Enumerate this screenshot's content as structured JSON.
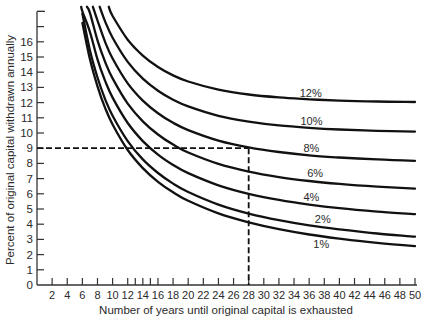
{
  "chart_data": {
    "type": "line",
    "title": "",
    "xlabel": "Number of years until original capital is exhausted",
    "ylabel": "Percent of original capital withdrawn annually",
    "xlim": [
      0,
      50
    ],
    "ylim": [
      0,
      18
    ],
    "grid": false,
    "legend": "inline labels on curves",
    "x_ticks": [
      2,
      4,
      6,
      8,
      10,
      12,
      13,
      14,
      15,
      16,
      18,
      20,
      22,
      24,
      26,
      28,
      30,
      32,
      34,
      36,
      38,
      40,
      42,
      44,
      46,
      48,
      50
    ],
    "x_tick_labels": [
      "2",
      "4",
      "6",
      "8",
      "10",
      "12",
      "14",
      "16",
      "18",
      "20",
      "22",
      "24",
      "26",
      "28",
      "30",
      "32",
      "34",
      "36",
      "38",
      "40",
      "42",
      "44",
      "46",
      "48",
      "50"
    ],
    "x_tick_label_values": [
      2,
      4,
      6,
      8,
      10,
      12,
      14,
      16,
      18,
      20,
      22,
      24,
      26,
      28,
      30,
      32,
      34,
      36,
      38,
      40,
      42,
      44,
      46,
      48,
      50
    ],
    "y_ticks": [
      1,
      2,
      3,
      4,
      5,
      6,
      7,
      8,
      9,
      10,
      11,
      12,
      13,
      14,
      15,
      16,
      17,
      18
    ],
    "y_tick_labels": [
      "0",
      "1",
      "2",
      "3",
      "4",
      "5",
      "6",
      "7",
      "8",
      "9",
      "10",
      "11",
      "12",
      "13",
      "14",
      "15",
      "16"
    ],
    "series": [
      {
        "name": "1%",
        "label": "1%",
        "label_pos": [
          37.6,
          2.7
        ],
        "x": [
          6,
          7,
          8,
          9,
          10,
          12,
          14,
          16,
          18,
          20,
          24,
          28,
          32,
          36,
          40,
          45,
          50
        ],
        "values": [
          17.25,
          14.86,
          13.07,
          11.67,
          10.56,
          8.88,
          7.69,
          6.79,
          6.1,
          5.54,
          4.71,
          4.12,
          3.67,
          3.32,
          3.05,
          2.77,
          2.56
        ]
      },
      {
        "name": "2%",
        "label": "2%",
        "label_pos": [
          37.8,
          4.35
        ],
        "x": [
          6,
          7,
          8,
          9,
          10,
          12,
          14,
          16,
          18,
          20,
          24,
          28,
          32,
          36,
          40,
          45,
          50
        ],
        "values": [
          17.85,
          15.45,
          13.65,
          12.25,
          11.13,
          9.46,
          8.26,
          7.37,
          6.67,
          6.12,
          5.29,
          4.7,
          4.26,
          3.92,
          3.66,
          3.39,
          3.18
        ]
      },
      {
        "name": "4%",
        "label": "4%",
        "label_pos": [
          36.3,
          5.8
        ],
        "x": [
          5.85,
          6,
          7,
          8,
          9,
          10,
          12,
          14,
          16,
          18,
          20,
          24,
          28,
          32,
          36,
          40,
          45,
          50
        ],
        "values": [
          18.3,
          18.0,
          16.66,
          14.85,
          13.45,
          12.33,
          10.66,
          9.47,
          8.58,
          7.9,
          7.36,
          6.56,
          6.0,
          5.6,
          5.29,
          5.05,
          4.83,
          4.66
        ]
      },
      {
        "name": "6%",
        "label": "6%",
        "label_pos": [
          36.8,
          7.4
        ],
        "x": [
          6.6,
          7,
          8,
          9,
          10,
          12,
          14,
          16,
          18,
          20,
          24,
          28,
          32,
          36,
          40,
          45,
          50
        ],
        "values": [
          18.3,
          17.91,
          16.1,
          14.7,
          13.59,
          11.93,
          10.76,
          9.9,
          9.24,
          8.72,
          7.97,
          7.46,
          7.1,
          6.84,
          6.65,
          6.47,
          6.34
        ]
      },
      {
        "name": "8%",
        "label": "8%",
        "label_pos": [
          36.3,
          9.0
        ],
        "x": [
          7.4,
          8,
          9,
          10,
          12,
          14,
          16,
          18,
          20,
          24,
          28,
          32,
          36,
          40,
          45,
          50
        ],
        "values": [
          18.3,
          17.4,
          16.01,
          14.9,
          13.27,
          12.13,
          11.3,
          10.67,
          10.19,
          9.5,
          9.05,
          8.75,
          8.53,
          8.39,
          8.26,
          8.17
        ]
      },
      {
        "name": "10%",
        "label": "10%",
        "label_pos": [
          36.3,
          10.8
        ],
        "x": [
          8.3,
          9,
          10,
          12,
          14,
          16,
          18,
          20,
          24,
          28,
          32,
          36,
          40,
          45,
          50
        ],
        "values": [
          18.3,
          17.36,
          16.27,
          14.68,
          13.57,
          12.78,
          12.19,
          11.75,
          11.13,
          10.75,
          10.5,
          10.34,
          10.23,
          10.14,
          10.09
        ]
      },
      {
        "name": "12%",
        "label": "12%",
        "label_pos": [
          36.2,
          12.65
        ],
        "x": [
          9.5,
          10,
          12,
          14,
          16,
          18,
          20,
          24,
          28,
          32,
          36,
          40,
          45,
          50
        ],
        "values": [
          18.3,
          17.7,
          16.14,
          15.09,
          14.34,
          13.79,
          13.39,
          12.85,
          12.53,
          12.34,
          12.22,
          12.13,
          12.07,
          12.04
        ]
      }
    ],
    "annotations": [
      {
        "type": "dashed-horizontal",
        "y": 9,
        "x_from": 0,
        "x_to": 28
      },
      {
        "type": "dashed-vertical",
        "x": 28,
        "y_from": 0,
        "y_to": 9
      }
    ]
  },
  "colors": {
    "background": "#ffffff",
    "line": "#111111",
    "text": "#2a2a2a"
  }
}
